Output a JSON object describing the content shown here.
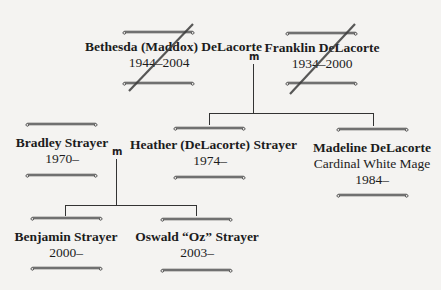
{
  "marriage_symbol": "m",
  "generations": [
    {
      "members": [
        {
          "id": "bethesda",
          "name": "Bethesda (Maddox) DeLacorte",
          "years": "1944–2004",
          "deceased": true
        },
        {
          "id": "franklin",
          "name": "Franklin DeLacorte",
          "years": "1934–2000",
          "deceased": true
        }
      ]
    },
    {
      "members": [
        {
          "id": "bradley",
          "name": "Bradley Strayer",
          "years": "1970–"
        },
        {
          "id": "heather",
          "name": "Heather (DeLacorte) Strayer",
          "years": "1974–"
        },
        {
          "id": "madeline",
          "name": "Madeline DeLacorte",
          "subtitle": "Cardinal White Mage",
          "years": "1984–"
        }
      ]
    },
    {
      "members": [
        {
          "id": "benjamin",
          "name": "Benjamin Strayer",
          "years": "2000–"
        },
        {
          "id": "oswald",
          "name": "Oswald “Oz” Strayer",
          "years": "2003–"
        }
      ]
    }
  ],
  "colors": {
    "background": "#f4f3f1",
    "line": "#333333",
    "strike": "#3a3a3a"
  }
}
